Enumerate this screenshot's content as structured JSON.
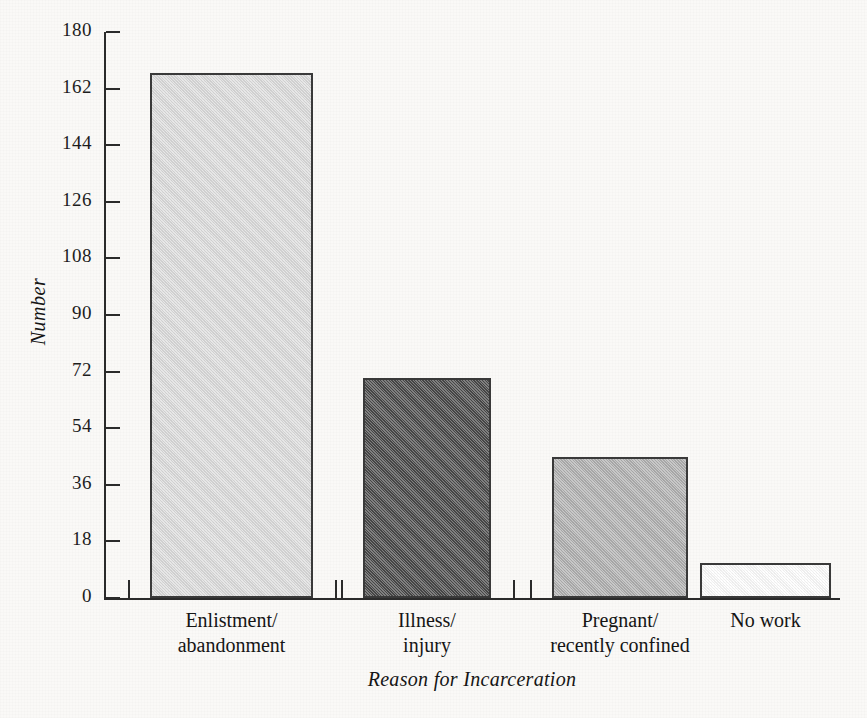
{
  "chart_data": {
    "type": "bar",
    "title": "",
    "subtitle": "",
    "xlabel": "Reason for Incarceration",
    "ylabel": "Number",
    "categories": [
      "Enlistment/ abandonment",
      "Illness/ injury",
      "Pregnant/ recently confined",
      "No work"
    ],
    "category_lines": [
      [
        "Enlistment/",
        "abandonment"
      ],
      [
        "Illness/",
        "injury"
      ],
      [
        "Pregnant/",
        "recently confined"
      ],
      [
        "No work"
      ]
    ],
    "values": [
      167,
      70,
      45,
      11
    ],
    "bar_colors": [
      "#dedede",
      "#4a4a4a",
      "#b2b2b2",
      "#ffffff"
    ],
    "ylim": [
      0,
      180
    ],
    "yticks": [
      0,
      18,
      36,
      54,
      72,
      90,
      108,
      126,
      144,
      162,
      180
    ],
    "ytick_labels": [
      "0",
      "18",
      "36",
      "54",
      "72",
      "90",
      "108",
      "126",
      "144",
      "162",
      "180"
    ],
    "grid": false,
    "legend": null,
    "legend_position": "none",
    "axis_color": "#2b2b2b",
    "background_color": "#faf9f7"
  }
}
